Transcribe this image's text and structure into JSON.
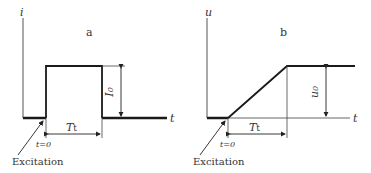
{
  "panels": [
    {
      "id": "a",
      "label": "a",
      "y_axis_label": "i",
      "x_axis_label": "t",
      "amplitude_label": "I",
      "amplitude_sub": "0",
      "duration_label": "T",
      "duration_sub": "t",
      "t0_label": "t=0",
      "excitation_label": "Excitation",
      "shape": "rectangular pulse"
    },
    {
      "id": "b",
      "label": "b",
      "y_axis_label": "u",
      "x_axis_label": "t",
      "amplitude_label": "u",
      "amplitude_sub": "0",
      "duration_label": "T",
      "duration_sub": "t",
      "t0_label": "t=0",
      "excitation_label": "Excitation",
      "shape": "ramp then constant"
    }
  ],
  "colors": {
    "line": "#1a1a1a",
    "thin_line": "#444444",
    "text": "#333333"
  }
}
